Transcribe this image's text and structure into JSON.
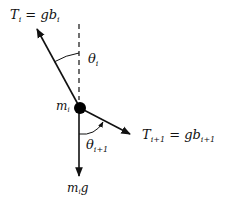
{
  "diagram": {
    "labels": {
      "tension_upper": {
        "T": "T",
        "sub": "i",
        "eq": " = ",
        "g": "g",
        "b": "b",
        "bsub": "i"
      },
      "theta_upper": {
        "theta": "θ",
        "sub": "i"
      },
      "mass": {
        "m": "m",
        "sub": "i"
      },
      "theta_lower": {
        "theta": "θ",
        "sub": "i+1"
      },
      "tension_lower": {
        "T": "T",
        "sub": "i+1",
        "eq": " = ",
        "g": "g",
        "b": "b",
        "bsub": "i+1"
      },
      "weight": {
        "m": "m",
        "sub": "i",
        "g": "g"
      }
    },
    "colors": {
      "line": "#111111",
      "mass": "#000000",
      "background": "#ffffff"
    }
  }
}
